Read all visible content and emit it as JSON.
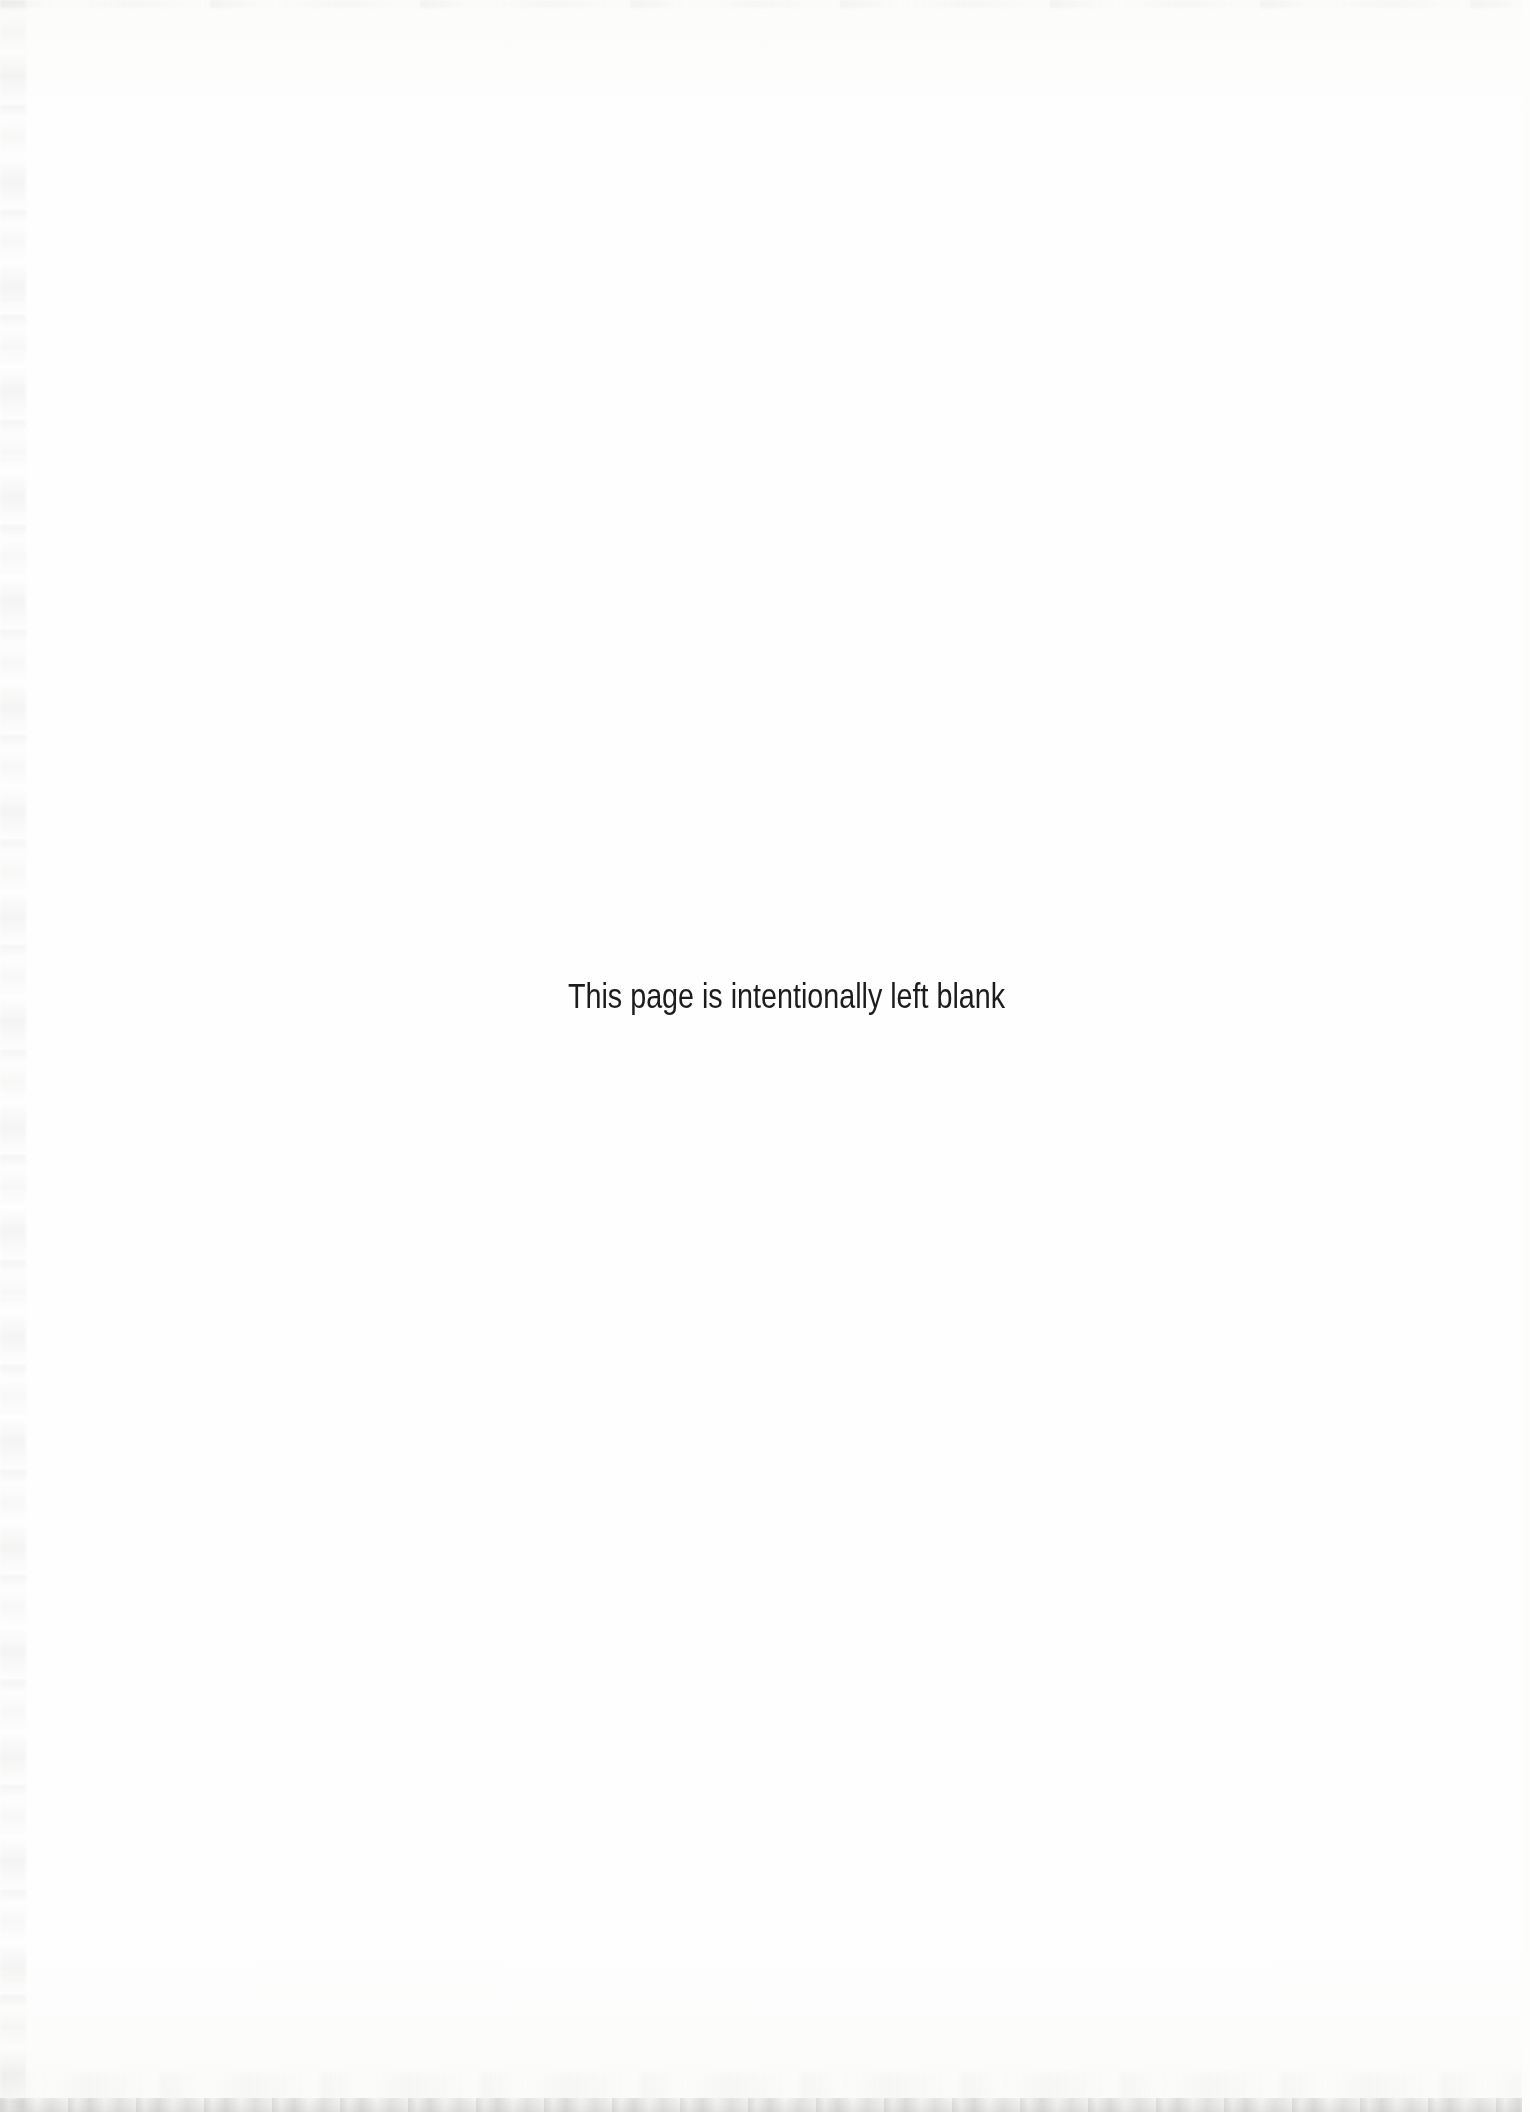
{
  "page": {
    "message": "This page is intentionally left blank"
  },
  "colors": {
    "background": "#fdfdfc",
    "text": "#1c1c1c",
    "edge_grain": "#8e8e8a"
  }
}
